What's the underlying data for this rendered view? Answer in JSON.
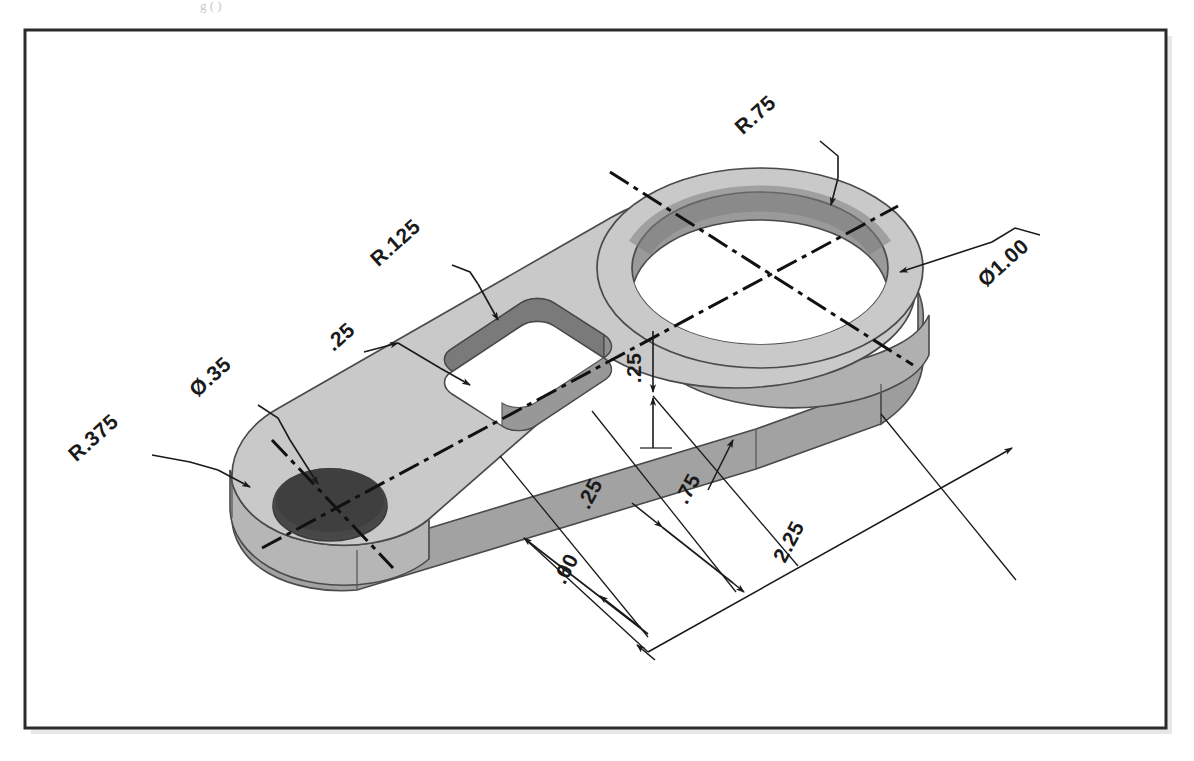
{
  "page": {
    "width": 1194,
    "height": 761,
    "background": "#ffffff",
    "title_fragment": "g (                  )"
  },
  "frame": {
    "name": "drawing-border",
    "x": 25,
    "y": 30,
    "width": 1141,
    "height": 698,
    "stroke": "#2b2b2b",
    "stroke_width": 3,
    "shadow": "#cfcfcf"
  },
  "part": {
    "description": "Isometric pictorial of a flat machined link / lever plate with a large circular boss end, a central rounded slot, and a small circular boss end",
    "colors": {
      "top_face": "#c9c9c9",
      "side_face_light": "#bdbdbd",
      "side_face_dark": "#a2a2a2",
      "bore_wall": "#9a9a9a",
      "bore_wall_dark": "#8f8f8f",
      "slot_wall": "#8d8d8d",
      "small_hole": "#4a4a4a",
      "outline": "#4a4a4a",
      "hole_floor": "#ffffff"
    }
  },
  "dimensions": [
    {
      "id": "r075",
      "label": "R.75",
      "type": "radius",
      "value": 0.75,
      "text_x": 760,
      "text_y": 120,
      "rotation": -42,
      "target": "outer radius of large boss end"
    },
    {
      "id": "d100",
      "label": "Ø1.00",
      "type": "diameter",
      "value": 1.0,
      "text_x": 1000,
      "text_y": 262,
      "rotation": -42,
      "target": "large through hole"
    },
    {
      "id": "r0125",
      "label": "R.125",
      "type": "radius",
      "value": 0.125,
      "text_x": 400,
      "text_y": 250,
      "rotation": -42,
      "target": "slot corner radius"
    },
    {
      "id": "slot25",
      "label": ".25",
      "type": "linear",
      "value": 0.25,
      "text_x": 352,
      "text_y": 345,
      "rotation": -42,
      "target": "slot width"
    },
    {
      "id": "d035",
      "label": "Ø.35",
      "type": "diameter",
      "value": 0.35,
      "text_x": 212,
      "text_y": 385,
      "rotation": -42,
      "target": "small hole"
    },
    {
      "id": "r0375",
      "label": "R.375",
      "type": "radius",
      "value": 0.375,
      "text_x": 96,
      "text_y": 440,
      "rotation": -42,
      "target": "outer radius of small boss end"
    },
    {
      "id": "thk25",
      "label": ".25",
      "type": "linear",
      "value": 0.25,
      "text_x": 637,
      "text_y": 372,
      "rotation": -90,
      "target": "plate thickness"
    },
    {
      "id": "off25",
      "label": ".25",
      "type": "linear",
      "value": 0.25,
      "text_x": 596,
      "text_y": 495,
      "rotation": -62,
      "target": "offset from slot end"
    },
    {
      "id": "d075",
      "label": ".75",
      "type": "linear",
      "value": 0.75,
      "text_x": 692,
      "text_y": 492,
      "rotation": -62,
      "target": "slot center distance"
    },
    {
      "id": "d060",
      "label": ".60",
      "type": "linear",
      "value": 0.6,
      "text_x": 571,
      "text_y": 571,
      "rotation": -62,
      "target": "first feature offset"
    },
    {
      "id": "d225",
      "label": "2.25",
      "type": "linear",
      "value": 2.25,
      "text_x": 793,
      "text_y": 543,
      "rotation": -62,
      "target": "overall length between hole centers"
    }
  ]
}
